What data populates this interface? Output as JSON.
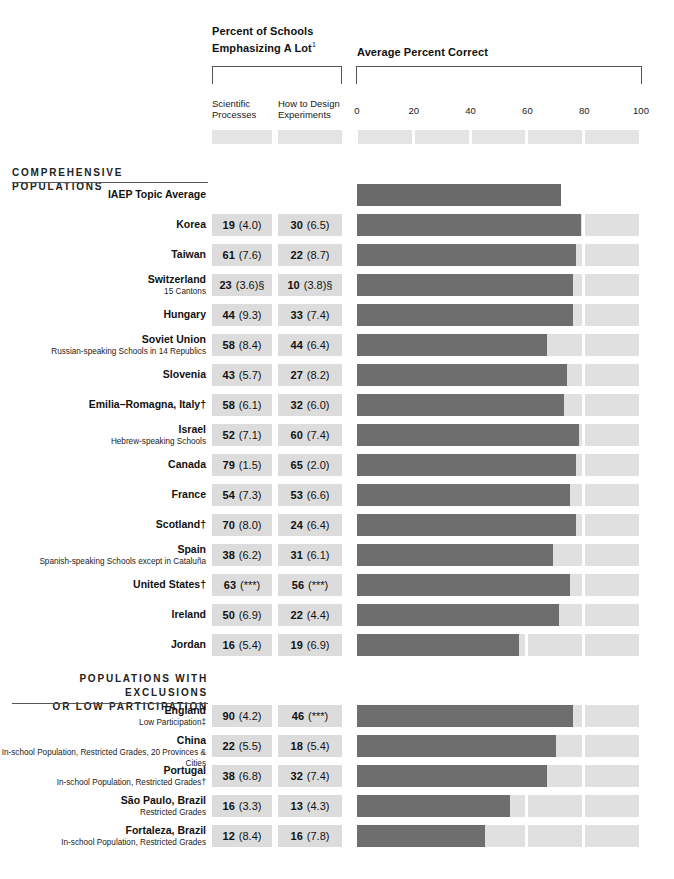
{
  "header": {
    "group_a_title": "Percent of Schools Emphasizing A Lot",
    "group_a_title_line1": "Percent of Schools",
    "group_a_title_line2": "Emphasizing A Lot",
    "group_a_footnote_marker": "1",
    "group_b_title": "Average Percent Correct",
    "col_a_line1": "Scientific",
    "col_a_line2": "Processes",
    "col_b_line1": "How to Design",
    "col_b_line2": "Experiments",
    "ticks": [
      "0",
      "20",
      "40",
      "60",
      "80",
      "100"
    ]
  },
  "sections": [
    {
      "id": "comprehensive",
      "title": "COMPREHENSIVE POPULATIONS"
    },
    {
      "id": "exclusions",
      "title_line1": "POPULATIONS WITH EXCLUSIONS",
      "title_line2": "OR LOW PARTICIPATION"
    }
  ],
  "colors": {
    "bar_dark": "#6e6e6e",
    "bar_light": "#e0e0e0",
    "cell_bg": "#dcdcdc",
    "swatch": "#e4e4e4",
    "rule": "#555555"
  },
  "chart_data": {
    "type": "bar",
    "xlabel": "Average Percent Correct",
    "ylabel": "",
    "xlim": [
      0,
      100
    ],
    "grid": true,
    "legend": "none",
    "columns": [
      "Scientific Processes",
      "How to Design Experiments",
      "Average Percent Correct"
    ],
    "categories": [
      "IAEP Topic Average",
      "Korea",
      "Taiwan",
      "Switzerland",
      "Hungary",
      "Soviet Union",
      "Slovenia",
      "Emilia–Romagna, Italy†",
      "Israel",
      "Canada",
      "France",
      "Scotland†",
      "Spain",
      "United States†",
      "Ireland",
      "Jordan",
      "England",
      "China",
      "Portugal",
      "São Paulo, Brazil",
      "Fortaleza, Brazil"
    ],
    "series": [
      {
        "name": "Average Percent Correct",
        "values": [
          72,
          79,
          77,
          76,
          76,
          67,
          74,
          73,
          78,
          77,
          75,
          77,
          69,
          75,
          71,
          57,
          76,
          70,
          67,
          54,
          45
        ]
      }
    ]
  },
  "rows_comprehensive": [
    {
      "name": "IAEP Topic Average",
      "sub": "",
      "sci": "",
      "sci_se": "",
      "des": "",
      "des_se": "",
      "correct": 72,
      "no_track": true
    },
    {
      "name": "Korea",
      "sub": "",
      "sci": "19",
      "sci_se": "(4.0)",
      "des": "30",
      "des_se": "(6.5)",
      "correct": 79,
      "no_track": false
    },
    {
      "name": "Taiwan",
      "sub": "",
      "sci": "61",
      "sci_se": "(7.6)",
      "des": "22",
      "des_se": "(8.7)",
      "correct": 77,
      "no_track": false
    },
    {
      "name": "Switzerland",
      "sub": "15 Cantons",
      "sci": "23",
      "sci_se": "(3.6)§",
      "des": "10",
      "des_se": "(3.8)§",
      "correct": 76,
      "no_track": false
    },
    {
      "name": "Hungary",
      "sub": "",
      "sci": "44",
      "sci_se": "(9.3)",
      "des": "33",
      "des_se": "(7.4)",
      "correct": 76,
      "no_track": false
    },
    {
      "name": "Soviet Union",
      "sub": "Russian-speaking Schools in 14 Republics",
      "sci": "58",
      "sci_se": "(8.4)",
      "des": "44",
      "des_se": "(6.4)",
      "correct": 67,
      "no_track": false
    },
    {
      "name": "Slovenia",
      "sub": "",
      "sci": "43",
      "sci_se": "(5.7)",
      "des": "27",
      "des_se": "(8.2)",
      "correct": 74,
      "no_track": false
    },
    {
      "name": "Emilia–Romagna, Italy†",
      "sub": "",
      "sci": "58",
      "sci_se": "(6.1)",
      "des": "32",
      "des_se": "(6.0)",
      "correct": 73,
      "no_track": false
    },
    {
      "name": "Israel",
      "sub": "Hebrew-speaking Schools",
      "sci": "52",
      "sci_se": "(7.1)",
      "des": "60",
      "des_se": "(7.4)",
      "correct": 78,
      "no_track": false
    },
    {
      "name": "Canada",
      "sub": "",
      "sci": "79",
      "sci_se": "(1.5)",
      "des": "65",
      "des_se": "(2.0)",
      "correct": 77,
      "no_track": false
    },
    {
      "name": "France",
      "sub": "",
      "sci": "54",
      "sci_se": "(7.3)",
      "des": "53",
      "des_se": "(6.6)",
      "correct": 75,
      "no_track": false
    },
    {
      "name": "Scotland†",
      "sub": "",
      "sci": "70",
      "sci_se": "(8.0)",
      "des": "24",
      "des_se": "(6.4)",
      "correct": 77,
      "no_track": false
    },
    {
      "name": "Spain",
      "sub": "Spanish-speaking Schools except in Cataluña",
      "sci": "38",
      "sci_se": "(6.2)",
      "des": "31",
      "des_se": "(6.1)",
      "correct": 69,
      "no_track": false
    },
    {
      "name": "United States†",
      "sub": "",
      "sci": "63",
      "sci_se": "(***)",
      "des": "56",
      "des_se": "(***)",
      "correct": 75,
      "no_track": false
    },
    {
      "name": "Ireland",
      "sub": "",
      "sci": "50",
      "sci_se": "(6.9)",
      "des": "22",
      "des_se": "(4.4)",
      "correct": 71,
      "no_track": false
    },
    {
      "name": "Jordan",
      "sub": "",
      "sci": "16",
      "sci_se": "(5.4)",
      "des": "19",
      "des_se": "(6.9)",
      "correct": 57,
      "no_track": false
    }
  ],
  "rows_exclusions": [
    {
      "name": "England",
      "sub": "Low Participation‡",
      "sci": "90",
      "sci_se": "(4.2)",
      "des": "46",
      "des_se": "(***)",
      "correct": 76,
      "no_track": false
    },
    {
      "name": "China",
      "sub": "In-school Population, Restricted Grades, 20 Provinces & Cities",
      "sci": "22",
      "sci_se": "(5.5)",
      "des": "18",
      "des_se": "(5.4)",
      "correct": 70,
      "no_track": false
    },
    {
      "name": "Portugal",
      "sub": "In-school Population, Restricted Grades†",
      "sci": "38",
      "sci_se": "(6.8)",
      "des": "32",
      "des_se": "(7.4)",
      "correct": 67,
      "no_track": false
    },
    {
      "name": "São Paulo, Brazil",
      "sub": "Restricted Grades",
      "sci": "16",
      "sci_se": "(3.3)",
      "des": "13",
      "des_se": "(4.3)",
      "correct": 54,
      "no_track": false
    },
    {
      "name": "Fortaleza, Brazil",
      "sub": "In-school Population, Restricted Grades",
      "sci": "12",
      "sci_se": "(8.4)",
      "des": "16",
      "des_se": "(7.8)",
      "correct": 45,
      "no_track": false
    }
  ]
}
